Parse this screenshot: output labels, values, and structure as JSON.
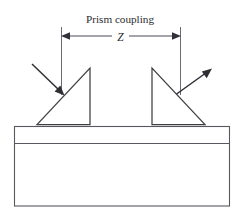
{
  "figure": {
    "title": "Prism coupling",
    "dimension_label": "Z",
    "background_color": "#ffffff",
    "line_color": "#3f3f44"
  },
  "labels": {
    "title": "Prism coupling",
    "separation": "Z"
  },
  "diagram": {
    "type": "optical-waveguide-prism-coupling",
    "elements": {
      "input_prism": {
        "name": "input-coupling-prism",
        "shape": "right-triangle",
        "vertices": "37,124 90,124 90,68",
        "vertical_edge": "right"
      },
      "output_prism": {
        "name": "output-coupling-prism",
        "shape": "right-triangle",
        "vertices": "152,68 152,124 205,124",
        "vertical_edge": "left"
      },
      "waveguide_film": {
        "name": "waveguide-film-layer",
        "x": 14,
        "y": 126,
        "width": 216,
        "height": 17
      },
      "substrate": {
        "name": "substrate-block",
        "x": 14,
        "y": 143,
        "width": 216,
        "height": 63
      },
      "incident_beam": {
        "name": "incident-light-ray",
        "direction": "down-right",
        "from": "32,64",
        "to": "63,94"
      },
      "outgoing_beam": {
        "name": "outgoing-light-ray",
        "direction": "up-right",
        "from": "171,98",
        "to": "211,69"
      },
      "dimension": {
        "name": "prism-separation-dimension",
        "label": "Z",
        "from_x": 61,
        "to_x": 180,
        "y": 36,
        "extension_top": 27,
        "extension_bottom": 95
      }
    }
  }
}
